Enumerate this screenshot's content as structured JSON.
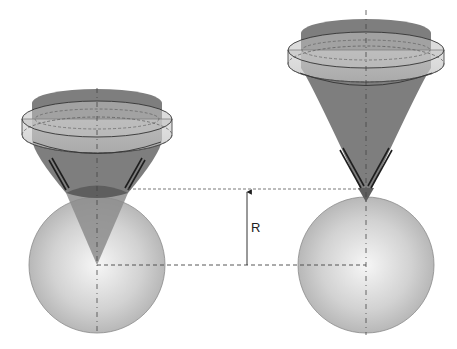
{
  "figure": {
    "type": "optical diagram",
    "labels": {
      "radius": "R"
    },
    "panels": [
      {
        "name": "left",
        "description": "Objective lens focusing cone onto sphere, focus at sphere center"
      },
      {
        "name": "right",
        "description": "Objective lens focusing cone onto sphere, focus at sphere top surface"
      }
    ],
    "colors": {
      "cone": "#7a7a7a",
      "lens_fill": "#c8c8c8",
      "sphere_center": "#f4f4f4",
      "sphere_edge": "#a8a8a8",
      "dashed_line": "#555555",
      "arrow": "#1e1e1e"
    }
  }
}
